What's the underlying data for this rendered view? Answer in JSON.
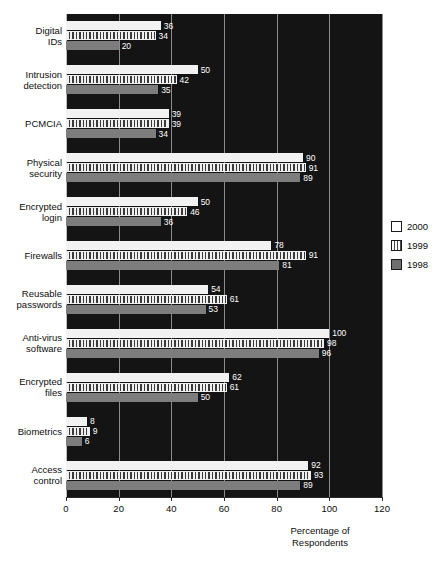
{
  "chart_data": {
    "type": "bar",
    "orientation": "horizontal",
    "title": "",
    "subtitle": "",
    "xlabel": "Percentage of\nRespondents",
    "ylabel": "",
    "xlim": [
      0,
      120
    ],
    "xticks": [
      0,
      20,
      40,
      60,
      80,
      100,
      120
    ],
    "xtick_labels": [
      "0",
      "20",
      "40",
      "60",
      "80",
      "100",
      "120"
    ],
    "grid": true,
    "grid_axis": "x",
    "legend_position": "right",
    "plot_background": "#141414",
    "categories": [
      "Digital\nIDs",
      "Intrusion\ndetection",
      "PCMCIA",
      "Physical\nsecurity",
      "Encrypted\nlogin",
      "Firewalls",
      "Reusable\npasswords",
      "Anti-virus\nsoftware",
      "Encrypted\nfiles",
      "Biometrics",
      "Access\ncontrol"
    ],
    "series": [
      {
        "name": "2000",
        "color": "#f2f2f2",
        "fill": "solid-white",
        "values": [
          36,
          50,
          39,
          90,
          50,
          78,
          54,
          100,
          62,
          8,
          92
        ]
      },
      {
        "name": "1999",
        "color": "#efefef",
        "fill": "vertical-stripes",
        "values": [
          34,
          42,
          39,
          91,
          46,
          91,
          61,
          98,
          61,
          9,
          93
        ]
      },
      {
        "name": "1998",
        "color": "#7d7d7d",
        "fill": "solid-gray",
        "values": [
          20,
          35,
          34,
          89,
          36,
          81,
          53,
          96,
          50,
          6,
          89
        ]
      }
    ]
  },
  "legend": {
    "items": [
      {
        "label": "2000",
        "swatch": "y2000"
      },
      {
        "label": "1999",
        "swatch": "y1999"
      },
      {
        "label": "1998",
        "swatch": "y1998"
      }
    ]
  }
}
